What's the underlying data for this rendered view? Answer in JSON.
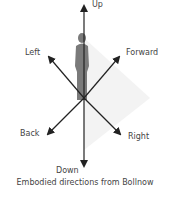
{
  "diagram": {
    "title": "Embodied directions from Bollnow",
    "directions": {
      "up": "Up",
      "down": "Down",
      "left": "Left",
      "right": "Right",
      "forward": "Forward",
      "back": "Back"
    },
    "figure": "human-silhouette",
    "colors": {
      "arrow": "#222222",
      "figure": "#7a7a7a",
      "shading": "#f2f2f2",
      "text": "#444444"
    }
  }
}
